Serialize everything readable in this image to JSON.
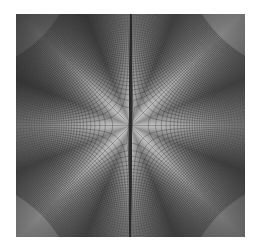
{
  "figure": {
    "colors": {
      "background": "#ffffff",
      "light": "#c8c8c8",
      "dark": "#5a5a5a",
      "grid_line": "#2a2a2a"
    }
  }
}
